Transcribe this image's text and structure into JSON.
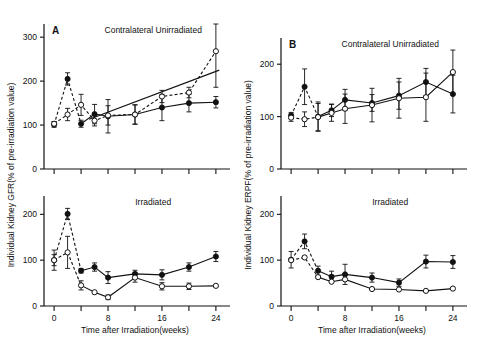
{
  "figure": {
    "xlabel": "Time after Irradiation(weeks)",
    "panels": [
      {
        "letter": "A",
        "ylabel": "Individual Kidney GFR(% of pre-irradiation value)",
        "subplots": [
          {
            "title": "Contralateral Unirradiated",
            "yticks": [
              0,
              100,
              200,
              300
            ]
          },
          {
            "title": "Irradiated",
            "yticks": [
              0,
              100,
              200
            ]
          }
        ]
      },
      {
        "letter": "B",
        "ylabel": "Individual Kidney ERPF(% of pre-irradiation value)",
        "subplots": [
          {
            "title": "Contralateral Unirradiated",
            "yticks": [
              0,
              100,
              200
            ]
          },
          {
            "title": "Irradiated",
            "yticks": [
              0,
              100,
              200
            ]
          }
        ]
      }
    ],
    "xticks_major": [
      0,
      8,
      16,
      24
    ],
    "xticks_minor": [
      4,
      12,
      20
    ]
  },
  "chart_data": [
    {
      "id": "panel-a-top",
      "type": "line",
      "title": "Contralateral Unirradiated",
      "panel": "A",
      "xlabel": "Time after Irradiation(weeks)",
      "ylabel": "Individual Kidney GFR(% of pre-irradiation value)",
      "xlim": [
        -1.5,
        25.5
      ],
      "ylim": [
        0,
        330
      ],
      "yticks": [
        0,
        100,
        200,
        300
      ],
      "xticks": [
        0,
        8,
        16,
        24
      ],
      "grid": false,
      "legend": "none",
      "series": [
        {
          "name": "filled-circles",
          "marker": "filled-circle",
          "linestyle": "dashed-then-solid",
          "x": [
            0,
            2,
            4,
            6,
            8,
            12,
            16,
            20,
            24
          ],
          "values": [
            101,
            205,
            103,
            125,
            120,
            124,
            140,
            150,
            152
          ],
          "errors": [
            6,
            14,
            8,
            22,
            38,
            22,
            30,
            20,
            13
          ]
        },
        {
          "name": "open-circles",
          "marker": "open-circle",
          "linestyle": "dashed",
          "x": [
            0,
            2,
            4,
            6,
            8,
            12,
            16,
            20,
            24
          ],
          "values": [
            103,
            124,
            146,
            110,
            122,
            124,
            165,
            174,
            268
          ],
          "errors": [
            5,
            14,
            24,
            12,
            22,
            22,
            14,
            12,
            82
          ]
        }
      ],
      "annotations": [
        {
          "type": "trend-line",
          "from": [
            5.2,
            113
          ],
          "to": [
            24.5,
            225
          ]
        }
      ]
    },
    {
      "id": "panel-a-bottom",
      "type": "line",
      "title": "Irradiated",
      "panel": "A",
      "xlabel": "Time after Irradiation(weeks)",
      "ylabel": "Individual Kidney GFR(% of pre-irradiation value)",
      "xlim": [
        -1.5,
        25.5
      ],
      "ylim": [
        0,
        240
      ],
      "yticks": [
        0,
        100,
        200
      ],
      "xticks": [
        0,
        8,
        16,
        24
      ],
      "grid": false,
      "legend": "none",
      "series": [
        {
          "name": "filled-circles",
          "marker": "filled-circle",
          "linestyle": "dashed-then-solid",
          "x": [
            0,
            2,
            4,
            6,
            8,
            12,
            16,
            20,
            24
          ],
          "values": [
            100,
            201,
            77,
            85,
            62,
            70,
            68,
            85,
            108
          ],
          "errors": [
            12,
            12,
            5,
            9,
            13,
            8,
            11,
            9,
            11
          ]
        },
        {
          "name": "open-circles",
          "marker": "open-circle",
          "linestyle": "dashed-then-solid",
          "x": [
            0,
            2,
            4,
            6,
            8,
            12,
            16,
            20,
            24
          ],
          "values": [
            100,
            117,
            45,
            30,
            19,
            62,
            43,
            43,
            44
          ],
          "errors": [
            22,
            35,
            10,
            0,
            5,
            10,
            8,
            7,
            0
          ]
        }
      ],
      "annotations": []
    },
    {
      "id": "panel-b-top",
      "type": "line",
      "title": "Contralateral Unirradiated",
      "panel": "B",
      "xlabel": "Time after Irradiation(weeks)",
      "ylabel": "Individual Kidney ERPF(% of pre-irradiation value)",
      "xlim": [
        -1.5,
        25.5
      ],
      "ylim": [
        0,
        250
      ],
      "yticks": [
        0,
        100,
        200
      ],
      "xticks": [
        0,
        8,
        16,
        24
      ],
      "grid": false,
      "legend": "none",
      "series": [
        {
          "name": "filled-circles",
          "marker": "filled-circle",
          "linestyle": "dashed-then-solid",
          "x": [
            0,
            2,
            4,
            6,
            8,
            12,
            16,
            20,
            24
          ],
          "values": [
            102,
            157,
            100,
            112,
            132,
            126,
            140,
            166,
            143
          ],
          "errors": [
            6,
            34,
            28,
            12,
            20,
            16,
            26,
            26,
            36
          ]
        },
        {
          "name": "open-circles",
          "marker": "open-circle",
          "linestyle": "dashed-then-solid",
          "x": [
            0,
            2,
            4,
            6,
            8,
            12,
            16,
            20,
            24
          ],
          "values": [
            98,
            95,
            99,
            107,
            115,
            122,
            135,
            137,
            185
          ],
          "errors": [
            7,
            14,
            26,
            16,
            28,
            32,
            38,
            46,
            42
          ]
        }
      ],
      "annotations": []
    },
    {
      "id": "panel-b-bottom",
      "type": "line",
      "title": "Irradiated",
      "panel": "B",
      "xlabel": "Time after Irradiation(weeks)",
      "ylabel": "Individual Kidney ERPF(% of pre-irradiation value)",
      "xlim": [
        -1.5,
        25.5
      ],
      "ylim": [
        0,
        240
      ],
      "yticks": [
        0,
        100,
        200
      ],
      "xticks": [
        0,
        8,
        16,
        24
      ],
      "grid": false,
      "legend": "none",
      "series": [
        {
          "name": "filled-circles",
          "marker": "filled-circle",
          "linestyle": "dashed-then-solid",
          "x": [
            0,
            2,
            4,
            6,
            8,
            12,
            16,
            20,
            24
          ],
          "values": [
            101,
            141,
            77,
            64,
            69,
            62,
            51,
            97,
            96
          ],
          "errors": [
            18,
            16,
            10,
            12,
            22,
            10,
            8,
            14,
            14
          ]
        },
        {
          "name": "open-circles",
          "marker": "open-circle",
          "linestyle": "dashed-then-solid",
          "x": [
            0,
            2,
            4,
            6,
            8,
            12,
            16,
            20,
            24
          ],
          "values": [
            100,
            106,
            63,
            53,
            58,
            37,
            36,
            33,
            38
          ]
        }
      ],
      "annotations": []
    }
  ]
}
